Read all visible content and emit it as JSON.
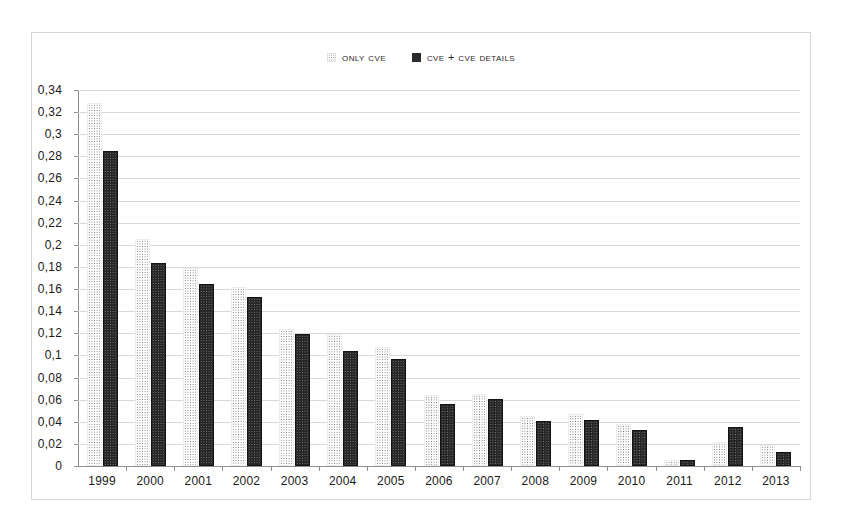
{
  "legend": {
    "position": "top-center",
    "items": [
      {
        "label": "Only CVE",
        "marker": "dotted-square-icon",
        "color": "#f2f2f2"
      },
      {
        "label": "CVE + CVE Details",
        "marker": "filled-square-icon",
        "color": "#262626"
      }
    ]
  },
  "axis": {
    "y_tick_labels": [
      "0,34",
      "0,32",
      "0,3",
      "0,28",
      "0,26",
      "0,24",
      "0,22",
      "0,2",
      "0,18",
      "0,16",
      "0,14",
      "0,12",
      "0,1",
      "0,08",
      "0,06",
      "0,04",
      "0,02",
      "0"
    ],
    "x_tick_labels": [
      "1999",
      "2000",
      "2001",
      "2002",
      "2003",
      "2004",
      "2005",
      "2006",
      "2007",
      "2008",
      "2009",
      "2010",
      "2011",
      "2012",
      "2013"
    ]
  },
  "chart_data": {
    "type": "bar",
    "title": "",
    "xlabel": "",
    "ylabel": "",
    "ylim": [
      0,
      0.34
    ],
    "ytick_step": 0.02,
    "grid": true,
    "legend_position": "top-center",
    "decimal_separator": ",",
    "categories": [
      "1999",
      "2000",
      "2001",
      "2002",
      "2003",
      "2004",
      "2005",
      "2006",
      "2007",
      "2008",
      "2009",
      "2010",
      "2011",
      "2012",
      "2013"
    ],
    "series": [
      {
        "name": "Only CVE",
        "color": "#f2f2f2",
        "pattern": "dotted",
        "values": [
          0.328,
          0.205,
          0.179,
          0.162,
          0.124,
          0.119,
          0.108,
          0.064,
          0.065,
          0.045,
          0.047,
          0.038,
          0.005,
          0.022,
          0.019
        ]
      },
      {
        "name": "CVE + CVE Details",
        "color": "#262626",
        "pattern": "solid",
        "values": [
          0.285,
          0.184,
          0.165,
          0.153,
          0.119,
          0.104,
          0.097,
          0.056,
          0.061,
          0.041,
          0.042,
          0.033,
          0.005,
          0.035,
          0.013
        ]
      }
    ]
  }
}
